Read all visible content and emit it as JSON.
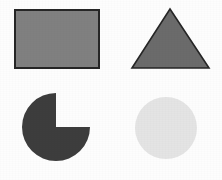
{
  "canvas": {
    "width": 222,
    "height": 180,
    "background_color": "#fdfdfd",
    "title": "Geometric shapes"
  },
  "palette": {
    "outline": "#262626",
    "medium_gray": "#808080",
    "dark_gray": "#6b6b6b",
    "darkest_gray": "#3d3d3d",
    "light_gray": "#e4e4e4"
  },
  "shapes": [
    {
      "id": "rectangle",
      "name": "rectangle",
      "label": "Gray rectangle",
      "fill": "#808080",
      "stroke": "#262626",
      "stroke_width": 1.6,
      "x": 15,
      "y": 10,
      "width": 84,
      "height": 58
    },
    {
      "id": "triangle",
      "name": "triangle",
      "label": "Dark gray triangle",
      "fill": "#6b6b6b",
      "stroke": "#262626",
      "stroke_width": 1.6,
      "points": "170,9 209,68 132,68"
    },
    {
      "id": "pac",
      "name": "three-quarter-circle",
      "label": "Three quarter circle",
      "fill": "#3d3d3d",
      "stroke": "none",
      "stroke_width": 0,
      "cx": 56,
      "cy": 127,
      "r": 34,
      "missing_quadrant": "upper-right",
      "path": "M 56 127 L 56 93 A 34 34 0 1 0 90 127 Z"
    },
    {
      "id": "circle",
      "name": "circle",
      "label": "Light gray circle",
      "fill": "#e4e4e4",
      "stroke": "none",
      "stroke_width": 0,
      "cx": 166,
      "cy": 128,
      "r": 31
    }
  ]
}
